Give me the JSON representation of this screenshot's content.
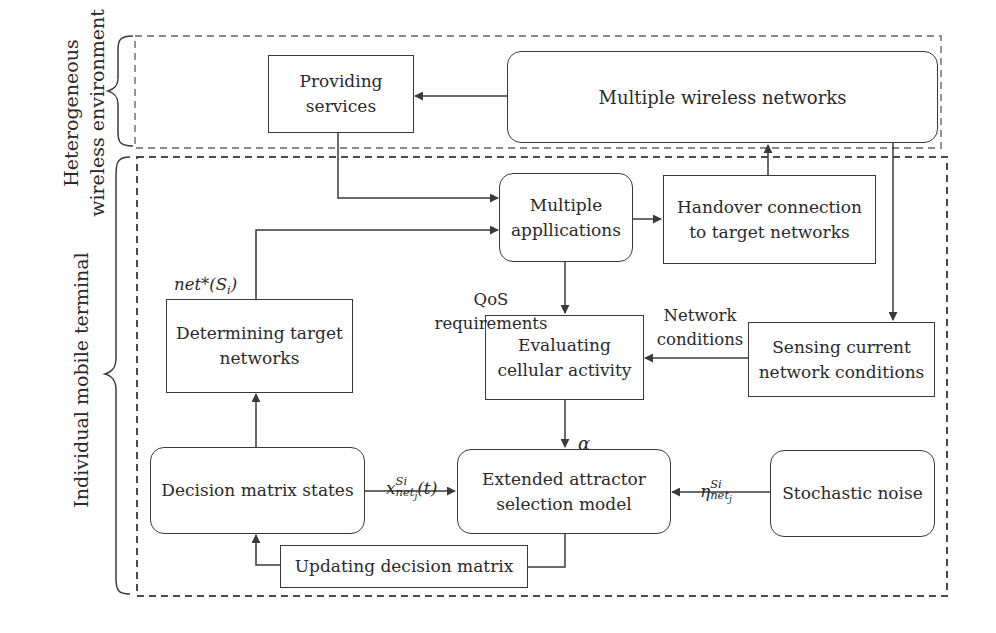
{
  "diagram": {
    "regions": {
      "heterogeneous": {
        "label_line1": "Heterogeneous",
        "label_line2": "wireless environment"
      },
      "terminal": {
        "label": "Individual mobile terminal"
      }
    },
    "nodes": {
      "providing_services": {
        "label": "Providing\nservices",
        "shape": "rect"
      },
      "multiple_wireless_networks": {
        "label": "Multiple wireless networks",
        "shape": "rounded"
      },
      "multiple_applications": {
        "label": "Multiple\napplications",
        "display_label": "Multiple\nappllications",
        "shape": "rounded"
      },
      "handover_connection": {
        "label": "Handover connection\nto target networks",
        "shape": "rect"
      },
      "determining_target_networks": {
        "label": "Determining target\nnetworks",
        "shape": "rect"
      },
      "evaluating_cellular_activity": {
        "label": "Evaluating\ncellular activity",
        "shape": "rect"
      },
      "sensing_network_conditions": {
        "label": "Sensing current\nnetwork conditions",
        "shape": "rect"
      },
      "decision_matrix_states": {
        "label": "Decision matrix states",
        "shape": "rounded"
      },
      "extended_attractor_model": {
        "label": "Extended attractor\nselection model",
        "shape": "rounded"
      },
      "stochastic_noise": {
        "label": "Stochastic noise",
        "shape": "rounded"
      },
      "updating_decision_matrix": {
        "label": "Updating decision matrix",
        "shape": "rect"
      }
    },
    "edge_labels": {
      "net_star": {
        "base": "net*(S",
        "sub": "i",
        "close": ")"
      },
      "qos": "QoS\nrequirements",
      "network_conditions": "Network\nconditions",
      "alpha": "α",
      "x_state": {
        "base": "x",
        "sup": "Si",
        "sub": "net",
        "subsub": "j",
        "tail": "(t)"
      },
      "eta_noise": {
        "base": "η",
        "sup": "Si",
        "sub": "net",
        "subsub": "j"
      }
    },
    "edges": [
      {
        "from": "multiple_wireless_networks",
        "to": "providing_services"
      },
      {
        "from": "providing_services",
        "to": "multiple_applications"
      },
      {
        "from": "determining_target_networks",
        "to": "multiple_applications",
        "label": "net*(S_i)"
      },
      {
        "from": "multiple_applications",
        "to": "handover_connection"
      },
      {
        "from": "handover_connection",
        "to": "multiple_wireless_networks"
      },
      {
        "from": "multiple_wireless_networks",
        "to": "sensing_network_conditions"
      },
      {
        "from": "multiple_applications",
        "to": "evaluating_cellular_activity",
        "label": "QoS requirements"
      },
      {
        "from": "sensing_network_conditions",
        "to": "evaluating_cellular_activity",
        "label": "Network conditions"
      },
      {
        "from": "evaluating_cellular_activity",
        "to": "extended_attractor_model",
        "label": "α"
      },
      {
        "from": "decision_matrix_states",
        "to": "extended_attractor_model",
        "label": "x_net_j^Si(t)"
      },
      {
        "from": "stochastic_noise",
        "to": "extended_attractor_model",
        "label": "η_net_j^Si"
      },
      {
        "from": "decision_matrix_states",
        "to": "determining_target_networks"
      },
      {
        "from": "extended_attractor_model",
        "to": "updating_decision_matrix"
      },
      {
        "from": "updating_decision_matrix",
        "to": "decision_matrix_states"
      }
    ],
    "colors": {
      "line": "#3a3a3a",
      "dash_outer_top": "#8a8a8a",
      "dash_outer_bottom": "#4a4a4a",
      "text": "#2a2a2a"
    }
  }
}
